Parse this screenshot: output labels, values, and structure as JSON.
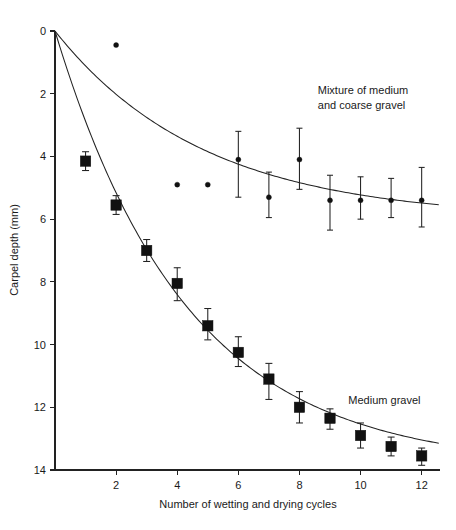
{
  "chart_data": {
    "type": "scatter",
    "title": "",
    "xlabel": "Number of wetting and drying cycles",
    "ylabel": "Carpel depth (mm)",
    "xlim": [
      0,
      12.6
    ],
    "ylim": [
      14,
      0
    ],
    "y_inverted": true,
    "grid": false,
    "legend_position": "inline-annotation",
    "xticks": [
      2,
      4,
      6,
      8,
      10,
      12
    ],
    "xtick_labels": [
      "2",
      "4",
      "6",
      "8",
      "10",
      "12"
    ],
    "yticks": [
      0,
      2,
      4,
      6,
      8,
      10,
      12,
      14
    ],
    "ytick_labels": [
      "0",
      "2",
      "4",
      "6",
      "8",
      "10",
      "12",
      "14"
    ],
    "annotations": [
      {
        "text_line1": "Mixture of medium",
        "text_line2": "and coarse gravel",
        "x": 8.6,
        "y": 2.0
      },
      {
        "text_line1": "Medium gravel",
        "text_line2": "",
        "x": 9.6,
        "y": 11.9
      }
    ],
    "series": [
      {
        "name": "Medium gravel",
        "marker": "filled-square",
        "has_fitted_curve": true,
        "has_error_bars": true,
        "x": [
          1,
          2,
          3,
          4,
          5,
          6,
          7,
          8,
          9,
          10,
          11,
          12
        ],
        "values": [
          4.15,
          5.55,
          7.0,
          8.05,
          9.4,
          10.25,
          11.1,
          12.0,
          12.35,
          12.9,
          13.25,
          13.55
        ],
        "error_low": [
          3.85,
          5.25,
          6.65,
          7.55,
          8.85,
          9.75,
          10.6,
          11.5,
          12.05,
          12.5,
          12.95,
          13.3
        ],
        "error_high": [
          4.45,
          5.85,
          7.35,
          8.6,
          9.85,
          10.7,
          11.75,
          12.5,
          12.7,
          13.3,
          13.55,
          13.85
        ]
      },
      {
        "name": "Mixture of medium and coarse gravel",
        "marker": "filled-dot",
        "has_fitted_curve": true,
        "has_error_bars": true,
        "x": [
          6,
          7,
          8,
          9,
          10,
          11,
          12
        ],
        "values": [
          4.1,
          5.3,
          4.1,
          5.4,
          5.4,
          5.4,
          5.4
        ],
        "error_low": [
          3.2,
          4.5,
          3.1,
          4.6,
          4.65,
          4.7,
          4.35
        ],
        "error_high": [
          5.3,
          5.95,
          5.05,
          6.35,
          6.0,
          5.95,
          6.25
        ]
      },
      {
        "name": "Mixture of medium and coarse gravel (no error bars)",
        "marker": "filled-dot",
        "has_fitted_curve": false,
        "has_error_bars": false,
        "x": [
          2,
          4,
          5
        ],
        "values": [
          0.45,
          4.9,
          4.9
        ]
      }
    ],
    "fitted_curves": [
      {
        "name": "Medium gravel fit",
        "model": "exponential-rise-to-asymptote",
        "through_origin": true,
        "asymptote": 13.9
      },
      {
        "name": "Mixture fit",
        "model": "exponential-rise-to-asymptote",
        "through_origin": true,
        "asymptote": 6.0
      }
    ]
  }
}
